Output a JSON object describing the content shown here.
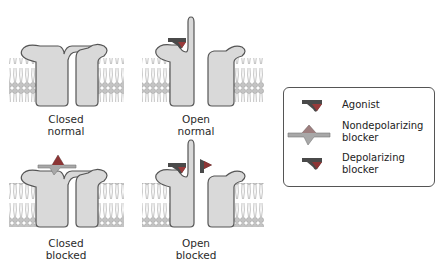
{
  "panels": [
    {
      "id": "closed-normal",
      "caption_line1": "Closed",
      "caption_line2": "normal"
    },
    {
      "id": "open-normal",
      "caption_line1": "Open",
      "caption_line2": "normal"
    },
    {
      "id": "closed-blocked",
      "caption_line1": "Closed",
      "caption_line2": "blocked"
    },
    {
      "id": "open-blocked",
      "caption_line1": "Open",
      "caption_line2": "blocked"
    }
  ],
  "legend": {
    "items": [
      {
        "icon": "agonist-icon",
        "label_line1": "Agonist",
        "label_line2": ""
      },
      {
        "icon": "nondepolarizing-blocker-icon",
        "label_line1": "Nondepolarizing",
        "label_line2": "blocker"
      },
      {
        "icon": "depolarizing-blocker-icon",
        "label_line1": "Depolarizing",
        "label_line2": "blocker"
      }
    ]
  },
  "colors": {
    "protein_fill": "#d9d9d9",
    "protein_stroke": "#555555",
    "membrane": "#b8b8b8",
    "agonist_dark": "#4a4a4a",
    "agonist_red": "#9a3b3b",
    "nondep_light": "#a8a8a8",
    "depolarizing_red": "#8c3535"
  }
}
